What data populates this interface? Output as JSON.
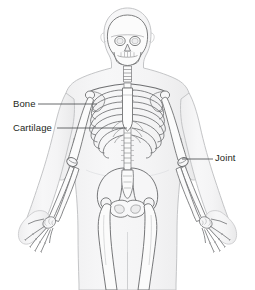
{
  "figure": {
    "background_color": "#ffffff",
    "width": 255,
    "height": 290
  },
  "labels": [
    {
      "id": "bone",
      "text": "Bone",
      "leader_line": {
        "x1": 38,
        "y1": 104,
        "x2": 97,
        "y2": 104
      },
      "points_to": "upper-arm-humerus"
    },
    {
      "id": "cartilage",
      "text": "Cartilage",
      "leader_line": {
        "x1": 57,
        "y1": 128,
        "x2": 127,
        "y2": 128
      },
      "points_to": "costal-cartilage-ribcage"
    },
    {
      "id": "joint",
      "text": "Joint",
      "leader_line": {
        "x1": 182,
        "y1": 159,
        "x2": 213,
        "y2": 159
      },
      "points_to": "elbow-joint"
    }
  ],
  "colors": {
    "body_outline": "#c8c9cb",
    "body_fill": "#f3f3f4",
    "bone_outline": "#6d6e71",
    "bone_fill": "#fbfbfb",
    "bone_shade": "#d6d7d9",
    "label_text": "#231f20",
    "leader_line": "#58595b"
  },
  "anatomy_parts": [
    "skull",
    "mandible",
    "eye-sockets",
    "teeth",
    "cervical-spine",
    "clavicle",
    "scapula",
    "sternum",
    "ribs",
    "costal-cartilage",
    "thoracic-spine",
    "lumbar-spine",
    "humerus",
    "elbow-joint",
    "radius",
    "ulna",
    "carpals",
    "metacarpals",
    "phalanges",
    "pelvis",
    "sacrum",
    "femur",
    "hip-joint"
  ]
}
